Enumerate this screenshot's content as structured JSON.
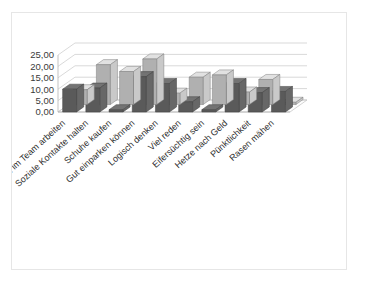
{
  "frame": {
    "border_color": "#e6e6e6",
    "background": "#ffffff"
  },
  "chart_data": {
    "type": "bar",
    "subtype": "3d-clustered-column",
    "title": "",
    "subtitle": "",
    "xlabel": "",
    "ylabel": "",
    "ylim": [
      0,
      25
    ],
    "grid": true,
    "legend": "none",
    "decimal_separator": ",",
    "ytick_labels": [
      "25,00",
      "20,00",
      "15,00",
      "10,00",
      "5,00",
      "0,00"
    ],
    "ytick_values": [
      25,
      20,
      15,
      10,
      5,
      0
    ],
    "categories": [
      "Gut im Team arbeiten",
      "Soziale Kontakte halten",
      "Schuhe kaufen",
      "Gut einparken können",
      "Logisch denken",
      "Viel reden",
      "Eifersüchtig sein",
      "Hetze nach Geld",
      "Pünktlichkeit",
      "Rasen mähen"
    ],
    "series": [
      {
        "name": "Serie 1",
        "color": "#5a5a5a",
        "values": [
          10.0,
          10.5,
          1.0,
          15.5,
          12.5,
          4.5,
          1.0,
          12.5,
          8.5,
          9.0
        ]
      },
      {
        "name": "Serie 2",
        "color": "#b0b0b0",
        "values": [
          6.5,
          17.5,
          14.5,
          20.0,
          5.0,
          12.0,
          13.0,
          5.5,
          11.0,
          1.0
        ]
      }
    ]
  }
}
